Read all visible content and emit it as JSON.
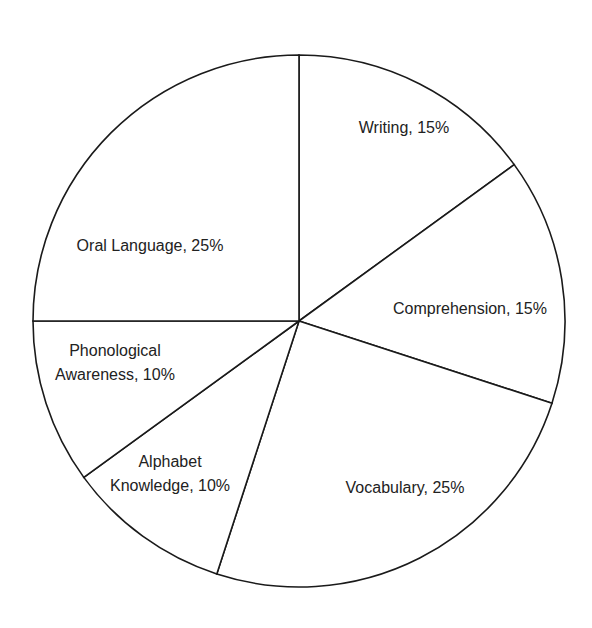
{
  "chart_data": {
    "type": "pie",
    "title": "",
    "start_angle": "12 o'clock",
    "direction": "clockwise",
    "categories": [
      "Writing",
      "Comprehension",
      "Vocabulary",
      "Alphabet Knowledge",
      "Phonological Awareness",
      "Oral Language"
    ],
    "values": [
      15,
      15,
      25,
      10,
      10,
      25
    ],
    "unit": "%",
    "labels": [
      {
        "lines": [
          "Writing, 15%"
        ],
        "x": 404,
        "y": 133
      },
      {
        "lines": [
          "Comprehension, 15%"
        ],
        "x": 470,
        "y": 314
      },
      {
        "lines": [
          "Vocabulary, 25%"
        ],
        "x": 405,
        "y": 493
      },
      {
        "lines": [
          "Alphabet",
          "Knowledge, 10%"
        ],
        "x": 170,
        "y": 467
      },
      {
        "lines": [
          "Phonological",
          "Awareness, 10%"
        ],
        "x": 115,
        "y": 356
      },
      {
        "lines": [
          "Oral Language, 25%"
        ],
        "x": 150,
        "y": 251
      }
    ],
    "colors": {
      "fill": "#ffffff",
      "stroke": "#1a1a1a",
      "text": "#222222"
    }
  }
}
